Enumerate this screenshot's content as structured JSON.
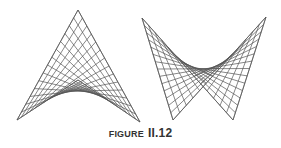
{
  "caption": {
    "word": "FIGURE",
    "number": "II.12"
  },
  "colors": {
    "line": "#555555",
    "background": "#ffffff",
    "caption": "#333333"
  },
  "figures": [
    {
      "name": "left-ruled-surface",
      "quad": {
        "A": [
          17,
          120
        ],
        "B": [
          78,
          10
        ],
        "C": [
          140,
          122
        ],
        "D": [
          78,
          80
        ]
      },
      "divisions": 14
    },
    {
      "name": "right-bowtie-surface",
      "quad": {
        "A": [
          142,
          18
        ],
        "B": [
          233,
          120
        ],
        "C": [
          266,
          17
        ],
        "D": [
          173,
          120
        ]
      },
      "divisions": 14
    }
  ]
}
